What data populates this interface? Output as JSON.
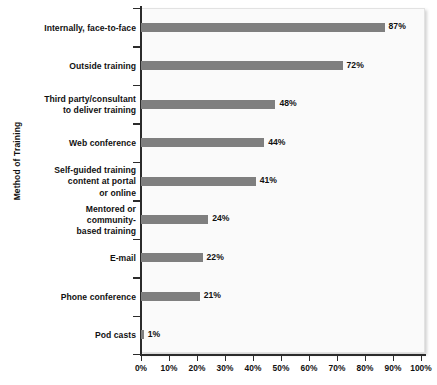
{
  "chart_data": {
    "type": "bar",
    "orientation": "horizontal",
    "title": "",
    "xlabel": "",
    "ylabel": "Method of Training",
    "xlim": [
      0,
      100
    ],
    "xtick_labels": [
      "0%",
      "10%",
      "20%",
      "30%",
      "40%",
      "50%",
      "60%",
      "70%",
      "80%",
      "90%",
      "100%"
    ],
    "xticks": [
      0,
      10,
      20,
      30,
      40,
      50,
      60,
      70,
      80,
      90,
      100
    ],
    "grid": false,
    "legend": false,
    "bar_color": "#7f7f7f",
    "plot_background": "#fafafa",
    "categories": [
      "Internally, face-to-face",
      "Outside training",
      "Third party/consultant to deliver training",
      "Web conference",
      "Self-guided training content at portal or online",
      "Mentored or community-based training",
      "E-mail",
      "Phone conference",
      "Pod casts"
    ],
    "category_lines": [
      [
        "Internally, face-to-face"
      ],
      [
        "Outside training"
      ],
      [
        "Third party/consultant",
        "to deliver training"
      ],
      [
        "Web conference"
      ],
      [
        "Self-guided training",
        "content at portal",
        "or online"
      ],
      [
        "Mentored or",
        "community-",
        "based training"
      ],
      [
        "E-mail"
      ],
      [
        "Phone conference"
      ],
      [
        "Pod casts"
      ]
    ],
    "values": [
      87,
      72,
      48,
      44,
      41,
      24,
      22,
      21,
      1
    ],
    "data_labels": [
      "87%",
      "72%",
      "48%",
      "44%",
      "41%",
      "24%",
      "22%",
      "21%",
      "1%"
    ]
  }
}
